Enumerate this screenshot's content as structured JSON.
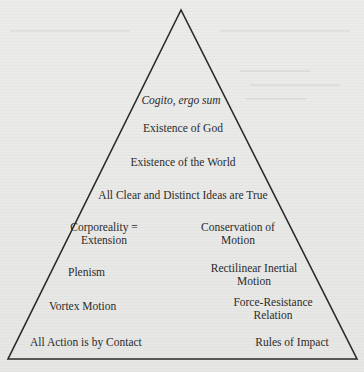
{
  "diagram": {
    "type": "pyramid",
    "shape": {
      "apex": [
        181,
        10
      ],
      "bottom_left": [
        8,
        359
      ],
      "bottom_right": [
        357,
        359
      ],
      "stroke_color": "#2a2a2a",
      "background_color": "#e9e9e7"
    },
    "tiers": {
      "cogito": "Cogito, ergo sum",
      "god": "Existence of God",
      "world": "Existence of the World",
      "clear_distinct": "All Clear and Distinct Ideas are True"
    },
    "left_column": {
      "corporeality_line1": "Corporeality =",
      "corporeality_line2": "Extension",
      "plenism": "Plenism",
      "vortex": "Vortex Motion",
      "contact": "All Action is by Contact"
    },
    "right_column": {
      "conservation_line1": "Conservation of",
      "conservation_line2": "Motion",
      "inertial_line1": "Rectilinear Inertial",
      "inertial_line2": "Motion",
      "force_line1": "Force-Resistance",
      "force_line2": "Relation",
      "impact": "Rules of Impact"
    }
  }
}
